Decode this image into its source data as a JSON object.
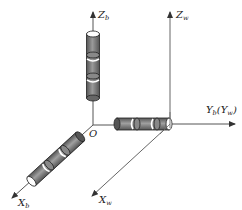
{
  "diagram": {
    "type": "coordinate-frames",
    "origin_label": "O",
    "axes": {
      "z_body": {
        "label": "Z",
        "sub": "b"
      },
      "z_world": {
        "label": "Z",
        "sub": "w"
      },
      "y_axis": {
        "label": "Y",
        "sub": "b",
        "paren_label": "Y",
        "paren_sub": "w"
      },
      "x_body": {
        "label": "X",
        "sub": "b"
      },
      "x_world": {
        "label": "X",
        "sub": "w"
      }
    },
    "colors": {
      "axis": "#555555",
      "cylinder_fill": "#7a7a7a",
      "cylinder_dark": "#5a5a5a",
      "cylinder_light": "#b5b5b5",
      "end_cap": "#ffffff",
      "stroke": "#222222"
    },
    "cylinders": [
      {
        "name": "vertical-rod",
        "orientation": "Z_b"
      },
      {
        "name": "horizontal-rod",
        "orientation": "Y_b"
      },
      {
        "name": "diagonal-rod",
        "orientation": "X_b"
      }
    ]
  }
}
